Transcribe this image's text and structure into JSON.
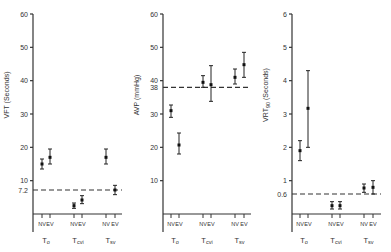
{
  "chart_data": [
    {
      "type": "scatter",
      "panel": "VFT",
      "ylabel": "VFT (Seconds)",
      "ylim": [
        0,
        60
      ],
      "yticks": [
        10,
        20,
        30,
        40,
        50,
        60
      ],
      "reference_line": {
        "value": 7.2,
        "label": "7.2",
        "style": "dashed"
      },
      "groups": [
        "To",
        "Tcvi",
        "Tsv"
      ],
      "subgroups": [
        "NV",
        "EV"
      ],
      "points": [
        {
          "group": "To",
          "sub": "NV",
          "mean": 15,
          "low": 13.5,
          "high": 16.5
        },
        {
          "group": "To",
          "sub": "EV",
          "mean": 17,
          "low": 15,
          "high": 19.5
        },
        {
          "group": "Tcvi",
          "sub": "NV",
          "mean": 2.5,
          "low": 1.7,
          "high": 3.3
        },
        {
          "group": "Tcvi",
          "sub": "EV",
          "mean": 4.2,
          "low": 3.1,
          "high": 5.5
        },
        {
          "group": "Tsv",
          "sub": "NV",
          "mean": 17,
          "low": 15,
          "high": 19.5
        },
        {
          "group": "Tsv",
          "sub": "EV",
          "mean": 7.2,
          "low": 5.8,
          "high": 8.6
        }
      ]
    },
    {
      "type": "scatter",
      "panel": "AVP",
      "ylabel": "AVP (mmHg)",
      "ylim": [
        0,
        60
      ],
      "yticks": [
        10,
        20,
        30,
        40,
        50,
        60
      ],
      "reference_line": {
        "value": 38,
        "label": "38",
        "style": "dashed"
      },
      "groups": [
        "To",
        "Tcvi",
        "Tsv"
      ],
      "subgroups": [
        "NV",
        "EV"
      ],
      "points": [
        {
          "group": "To",
          "sub": "NV",
          "mean": 31,
          "low": 29,
          "high": 32.7
        },
        {
          "group": "To",
          "sub": "EV",
          "mean": 20.7,
          "low": 18,
          "high": 24.3
        },
        {
          "group": "Tcvi",
          "sub": "NV",
          "mean": 39.5,
          "low": 38,
          "high": 41.5
        },
        {
          "group": "Tcvi",
          "sub": "EV",
          "mean": 38.8,
          "low": 33.8,
          "high": 44.5
        },
        {
          "group": "Tsv",
          "sub": "NV",
          "mean": 41,
          "low": 39,
          "high": 43.5
        },
        {
          "group": "Tsv",
          "sub": "EV",
          "mean": 44.8,
          "low": 41,
          "high": 48.5
        }
      ]
    },
    {
      "type": "scatter",
      "panel": "VRT90",
      "ylabel": "VRT90 (Seconds)",
      "ylim": [
        0,
        6
      ],
      "yticks": [
        1,
        2,
        3,
        4,
        5,
        6
      ],
      "reference_line": {
        "value": 0.6,
        "label": "0.6",
        "style": "dashed"
      },
      "groups": [
        "To",
        "Tcvi",
        "Tsv"
      ],
      "subgroups": [
        "NV",
        "EV"
      ],
      "points": [
        {
          "group": "To",
          "sub": "NV",
          "mean": 1.9,
          "low": 1.6,
          "high": 2.2
        },
        {
          "group": "To",
          "sub": "EV",
          "mean": 3.17,
          "low": 2.0,
          "high": 4.3
        },
        {
          "group": "Tcvi",
          "sub": "NV",
          "mean": 0.25,
          "low": 0.15,
          "high": 0.37
        },
        {
          "group": "Tcvi",
          "sub": "EV",
          "mean": 0.25,
          "low": 0.15,
          "high": 0.37
        },
        {
          "group": "Tsv",
          "sub": "NV",
          "mean": 0.78,
          "low": 0.65,
          "high": 0.9
        },
        {
          "group": "Tsv",
          "sub": "EV",
          "mean": 0.8,
          "low": 0.6,
          "high": 1.0
        }
      ]
    }
  ],
  "labels": {
    "p1": {
      "ylabel": "VFT (Seconds)",
      "ref": "7.2",
      "ticks": [
        "10",
        "20",
        "30",
        "40",
        "50",
        "60"
      ]
    },
    "p2": {
      "ylabel_main": "AVP",
      "ylabel_unit": "(mmHg)",
      "ref": "38",
      "ticks": [
        "10",
        "20",
        "30",
        "40",
        "50",
        "60"
      ]
    },
    "p3": {
      "ylabel_main": "VRT",
      "ylabel_sub": "90",
      "ylabel_unit": "(Seconds)",
      "ref": "0.6",
      "ticks": [
        "1",
        "2",
        "3",
        "4",
        "5",
        "6"
      ]
    },
    "sub_nv": "NV",
    "sub_ev": "EV",
    "group_to": "To",
    "group_tcvi": "Tcvi",
    "group_tsv": "Tsv"
  }
}
